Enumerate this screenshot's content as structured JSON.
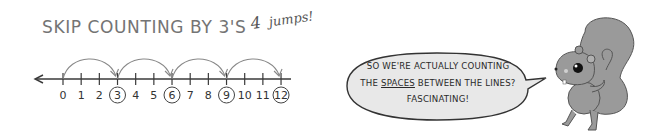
{
  "title": "SKIP COUNTING BY 3'S",
  "handwritten_note": {
    "number": "4",
    "text": "jumps!"
  },
  "number_line": {
    "start": 0,
    "end": 12,
    "step": 1,
    "labels": [
      "0",
      "1",
      "2",
      "3",
      "4",
      "5",
      "6",
      "7",
      "8",
      "9",
      "10",
      "11",
      "12"
    ],
    "circled": [
      "3",
      "6",
      "9",
      "12"
    ],
    "jumps": [
      [
        0,
        3
      ],
      [
        3,
        6
      ],
      [
        6,
        9
      ],
      [
        9,
        12
      ]
    ],
    "left_arrow": true
  },
  "speech_bubble": {
    "line1": "SO WE'RE ACTUALLY COUNTING",
    "line2_prefix": "THE ",
    "line2_underlined": "SPACES",
    "line2_suffix": " BETWEEN THE LINES?",
    "line3": "FASCINATING!"
  },
  "character": "squirrel",
  "colors": {
    "title": "#747474",
    "line": "#3a3a3a",
    "arc": "#888888",
    "bubble_fill": "#e8e8e8",
    "squirrel_fill": "#9a9a9a"
  }
}
